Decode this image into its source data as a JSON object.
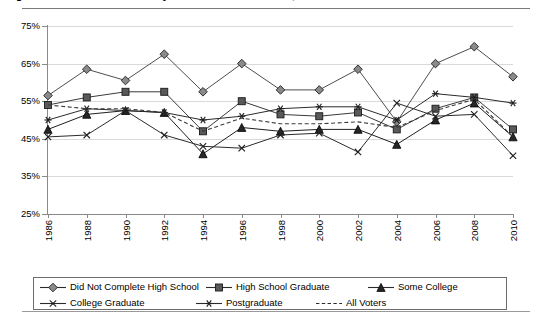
{
  "title": "Figure 1. Voter turnout rates by educational attainment, 1986-2010",
  "chart_data": {
    "type": "line",
    "title": "Voter turnout rates by educational attainment, 1986-2010",
    "xlabel": "",
    "ylabel": "",
    "grid": true,
    "legend_position": "bottom",
    "ylim": [
      25,
      75
    ],
    "ytick_labels": [
      "75%",
      "65%",
      "55%",
      "45%",
      "35%",
      "25%"
    ],
    "ytick_values": [
      75,
      65,
      55,
      45,
      35,
      25
    ],
    "x": [
      1986,
      1988,
      1990,
      1992,
      1994,
      1996,
      1998,
      2000,
      2002,
      2004,
      2006,
      2008,
      2010
    ],
    "xtick_labels": [
      "1986",
      "1988",
      "1990",
      "1992",
      "1994",
      "1996",
      "1998",
      "2000",
      "2002",
      "2004",
      "2006",
      "2008",
      "2010"
    ],
    "series": [
      {
        "name": "Did Not Complete High School",
        "marker": "diamond",
        "line": "solid",
        "color": "#4d4d4d",
        "values": [
          56.5,
          63.5,
          60.5,
          67.5,
          57.5,
          65.0,
          58.0,
          58.0,
          63.5,
          49.5,
          65.0,
          69.5,
          61.5
        ]
      },
      {
        "name": "High School Graduate",
        "marker": "square",
        "line": "solid",
        "color": "#3a3a3a",
        "values": [
          54.0,
          56.0,
          57.5,
          57.5,
          47.0,
          55.0,
          51.5,
          51.0,
          52.0,
          47.5,
          53.0,
          56.0,
          47.5
        ]
      },
      {
        "name": "Some College",
        "marker": "triangle",
        "line": "solid",
        "color": "#1f1f1f",
        "values": [
          47.5,
          51.5,
          52.5,
          52.0,
          41.0,
          48.0,
          47.0,
          47.5,
          47.5,
          43.5,
          50.0,
          54.5,
          45.5
        ]
      },
      {
        "name": "College Graduate",
        "marker": "x",
        "line": "solid",
        "color": "#2b2b2b",
        "values": [
          45.5,
          46.0,
          52.5,
          46.0,
          43.0,
          42.5,
          46.0,
          46.5,
          41.5,
          54.5,
          51.0,
          51.5,
          40.5
        ]
      },
      {
        "name": "Postgraduate",
        "marker": "asterisk",
        "line": "solid",
        "color": "#2b2b2b",
        "values": [
          50.0,
          53.0,
          52.5,
          52.0,
          50.0,
          51.0,
          53.0,
          53.5,
          53.5,
          50.0,
          57.0,
          56.0,
          54.5
        ]
      },
      {
        "name": "All Voters",
        "marker": "none",
        "line": "dashed",
        "color": "#3a3a3a",
        "values": [
          54.0,
          53.0,
          53.0,
          52.0,
          47.0,
          50.5,
          49.0,
          49.0,
          49.5,
          48.0,
          52.5,
          55.5,
          45.5
        ]
      }
    ]
  },
  "legend": {
    "rows": [
      [
        {
          "label": "Did Not Complete High School",
          "marker": "diamond",
          "line": "solid"
        },
        {
          "label": "High School Graduate",
          "marker": "square",
          "line": "solid"
        },
        {
          "label": "Some College",
          "marker": "triangle",
          "line": "solid"
        }
      ],
      [
        {
          "label": "College Graduate",
          "marker": "x",
          "line": "solid"
        },
        {
          "label": "Postgraduate",
          "marker": "asterisk",
          "line": "solid"
        },
        {
          "label": "All Voters",
          "marker": "none",
          "line": "dashed"
        }
      ]
    ]
  }
}
